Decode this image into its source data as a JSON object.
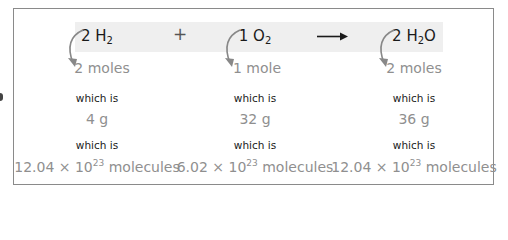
{
  "equation": {
    "terms": [
      {
        "coefficient": "2",
        "element": "H",
        "subscript": "2",
        "after": ""
      },
      {
        "coefficient": "1",
        "element": "O",
        "subscript": "2",
        "after": ""
      },
      {
        "coefficient": "2",
        "element": "H",
        "subscript": "2",
        "after": "O"
      }
    ],
    "plus_symbol": "+",
    "yield_icon": "right-arrow-icon"
  },
  "columns": [
    {
      "moles": "2 moles",
      "which_is_1": "which is",
      "mass": "4 g",
      "which_is_2": "which is",
      "molecules_mantissa": "12.04 × 10",
      "molecules_exponent": "23",
      "molecules_unit": " molecules"
    },
    {
      "moles": "1 mole",
      "which_is_1": "which is",
      "mass": "32 g",
      "which_is_2": "which is",
      "molecules_mantissa": "6.02 × 10",
      "molecules_exponent": "23",
      "molecules_unit": " molecules"
    },
    {
      "moles": "2 moles",
      "which_is_1": "which is",
      "mass": "36 g",
      "which_is_2": "which is",
      "molecules_mantissa": "12.04 × 10",
      "molecules_exponent": "23",
      "molecules_unit": " molecules"
    }
  ],
  "colors": {
    "band": "#efefef",
    "border": "#8a8a8a",
    "primary_text": "#1a1a1a",
    "secondary_text": "#8f8f8f",
    "curved_arrow": "#888888"
  }
}
